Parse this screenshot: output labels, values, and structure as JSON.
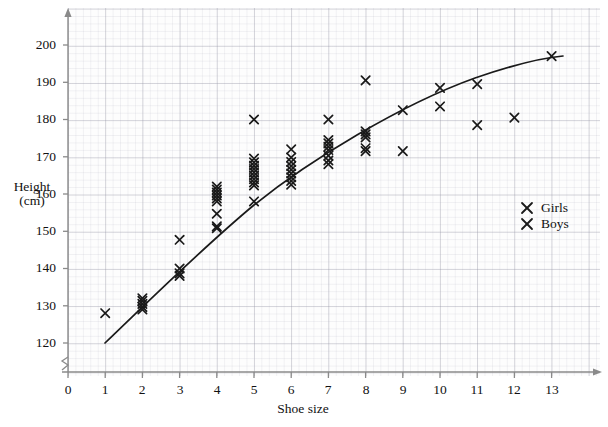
{
  "figure": {
    "axis_label_x": "Shoe size",
    "axis_label_y_line1": "Height",
    "axis_label_y_line2": "(cm)",
    "marker_glyph": "✕",
    "ink_color": "#1a1a1a",
    "grid_color": "#b4b4c0",
    "axis_color": "#8a8a8a"
  },
  "legend": {
    "position": "right-middle",
    "entries": [
      {
        "marker": "✕",
        "label": "Girls"
      },
      {
        "marker": "✕",
        "label": "Boys"
      }
    ]
  },
  "chart_data": {
    "type": "scatter",
    "title": "",
    "xlabel": "Shoe size",
    "ylabel": "Height (cm)",
    "xlim": [
      0,
      13.8
    ],
    "ylim": [
      115,
      207
    ],
    "y_axis_break": true,
    "grid": true,
    "xticks": [
      0,
      1,
      2,
      3,
      4,
      5,
      6,
      7,
      8,
      9,
      10,
      11,
      12,
      13
    ],
    "yticks": [
      120,
      130,
      140,
      150,
      160,
      170,
      180,
      190,
      200
    ],
    "legend": [
      "Girls",
      "Boys"
    ],
    "points": [
      {
        "x": 1,
        "y": 128
      },
      {
        "x": 2,
        "y": 132
      },
      {
        "x": 2,
        "y": 131.3
      },
      {
        "x": 2,
        "y": 130.5
      },
      {
        "x": 2,
        "y": 129.7
      },
      {
        "x": 2,
        "y": 129
      },
      {
        "x": 3,
        "y": 147.7
      },
      {
        "x": 3,
        "y": 140
      },
      {
        "x": 3,
        "y": 138.7
      },
      {
        "x": 3,
        "y": 138
      },
      {
        "x": 4,
        "y": 162
      },
      {
        "x": 4,
        "y": 161.2
      },
      {
        "x": 4,
        "y": 160.4
      },
      {
        "x": 4,
        "y": 159.6
      },
      {
        "x": 4,
        "y": 158.8
      },
      {
        "x": 4,
        "y": 158
      },
      {
        "x": 4,
        "y": 154.7
      },
      {
        "x": 4,
        "y": 151.3
      },
      {
        "x": 4,
        "y": 150.8
      },
      {
        "x": 5,
        "y": 180
      },
      {
        "x": 5,
        "y": 169.5
      },
      {
        "x": 5,
        "y": 168.5
      },
      {
        "x": 5,
        "y": 167.6
      },
      {
        "x": 5,
        "y": 166.7
      },
      {
        "x": 5,
        "y": 165.8
      },
      {
        "x": 5,
        "y": 164.9
      },
      {
        "x": 5,
        "y": 164
      },
      {
        "x": 5,
        "y": 163.1
      },
      {
        "x": 5,
        "y": 162.3
      },
      {
        "x": 5,
        "y": 158
      },
      {
        "x": 6,
        "y": 172
      },
      {
        "x": 6,
        "y": 169.8
      },
      {
        "x": 6,
        "y": 168.6
      },
      {
        "x": 6,
        "y": 167.5
      },
      {
        "x": 6,
        "y": 166.5
      },
      {
        "x": 6,
        "y": 165.5
      },
      {
        "x": 6,
        "y": 164.5
      },
      {
        "x": 6,
        "y": 163.5
      },
      {
        "x": 6,
        "y": 162.5
      },
      {
        "x": 7,
        "y": 180
      },
      {
        "x": 7,
        "y": 174.5
      },
      {
        "x": 7,
        "y": 173.6
      },
      {
        "x": 7,
        "y": 172.7
      },
      {
        "x": 7,
        "y": 171.8
      },
      {
        "x": 7,
        "y": 170.3
      },
      {
        "x": 7,
        "y": 169
      },
      {
        "x": 7,
        "y": 168
      },
      {
        "x": 8,
        "y": 190.5
      },
      {
        "x": 8,
        "y": 176.8
      },
      {
        "x": 8,
        "y": 176
      },
      {
        "x": 8,
        "y": 175.2
      },
      {
        "x": 8,
        "y": 172.3
      },
      {
        "x": 8,
        "y": 171.5
      },
      {
        "x": 9,
        "y": 182.5
      },
      {
        "x": 9,
        "y": 171.5
      },
      {
        "x": 10,
        "y": 188.5
      },
      {
        "x": 10,
        "y": 183.5
      },
      {
        "x": 11,
        "y": 189.5
      },
      {
        "x": 11,
        "y": 178.5
      },
      {
        "x": 12,
        "y": 180.5
      },
      {
        "x": 13,
        "y": 197
      }
    ],
    "trend_line": {
      "style": "curve-of-best-fit",
      "x_start": 1,
      "y_start": 120,
      "x_end": 13.2,
      "y_end": 196.2,
      "shape": "concave-down"
    }
  }
}
